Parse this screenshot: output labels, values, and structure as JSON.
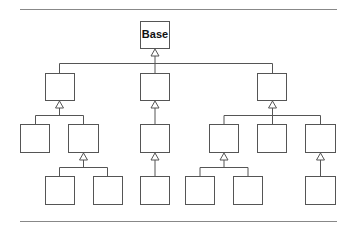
{
  "diagram": {
    "type": "class-inheritance-hierarchy",
    "root": {
      "label": "Base"
    },
    "nodes": [
      {
        "id": "base",
        "label": "Base",
        "level": 0
      },
      {
        "id": "a",
        "label": "",
        "level": 1,
        "parent": "base"
      },
      {
        "id": "b",
        "label": "",
        "level": 1,
        "parent": "base"
      },
      {
        "id": "c",
        "label": "",
        "level": 1,
        "parent": "base"
      },
      {
        "id": "a1",
        "label": "",
        "level": 2,
        "parent": "a"
      },
      {
        "id": "a2",
        "label": "",
        "level": 2,
        "parent": "a"
      },
      {
        "id": "b1",
        "label": "",
        "level": 2,
        "parent": "b"
      },
      {
        "id": "c1",
        "label": "",
        "level": 2,
        "parent": "c"
      },
      {
        "id": "c2",
        "label": "",
        "level": 2,
        "parent": "c"
      },
      {
        "id": "c3",
        "label": "",
        "level": 2,
        "parent": "c"
      },
      {
        "id": "a2a",
        "label": "",
        "level": 3,
        "parent": "a2"
      },
      {
        "id": "a2b",
        "label": "",
        "level": 3,
        "parent": "a2"
      },
      {
        "id": "b1a",
        "label": "",
        "level": 3,
        "parent": "b1"
      },
      {
        "id": "c1a",
        "label": "",
        "level": 3,
        "parent": "c1"
      },
      {
        "id": "c1b",
        "label": "",
        "level": 3,
        "parent": "c1"
      },
      {
        "id": "c3a",
        "label": "",
        "level": 3,
        "parent": "c3"
      }
    ],
    "edge_style": "hollow-triangle-generalization"
  }
}
